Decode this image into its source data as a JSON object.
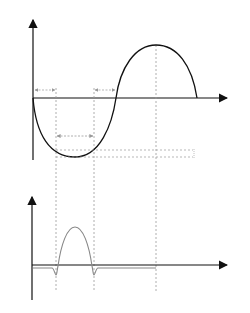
{
  "top_plot": {
    "y_axis_label": "z",
    "x_axis_label": "t",
    "delta_t_left_label": "Δt",
    "delta_t_right_label": "Δt",
    "tau_label": "τ",
    "delta_z_label": "Δz",
    "curve_color": "#111111"
  },
  "bottom_plot": {
    "y_axis_label": "F",
    "x_axis_label": "t",
    "curve_color": "#888888"
  },
  "colors": {
    "axis": "#111111",
    "dashed_guides": "#999999",
    "force_curve": "#888888"
  }
}
